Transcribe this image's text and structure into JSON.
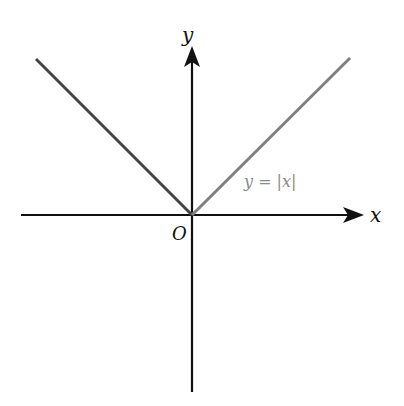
{
  "diagram": {
    "type": "function-graph",
    "function": "y = |x|",
    "axes": {
      "x_label": "x",
      "y_label": "y",
      "origin_label": "O"
    },
    "curve_label": "y = |x|",
    "colors": {
      "axes": "#111111",
      "left_branch": "#444444",
      "right_branch": "#808080",
      "curve_label": "#8a8a8a"
    }
  }
}
